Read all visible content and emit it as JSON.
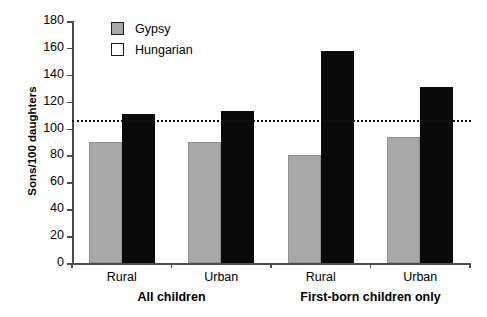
{
  "chart_data": {
    "type": "bar",
    "title": "",
    "xlabel": "",
    "ylabel": "Sons/100 daughters",
    "ylim": [
      0,
      180
    ],
    "yticks": [
      0,
      20,
      40,
      60,
      80,
      100,
      120,
      140,
      160,
      180
    ],
    "grid": false,
    "legend_position": "top-left-inside",
    "categories": [
      "Rural",
      "Urban",
      "Rural",
      "Urban"
    ],
    "groups": [
      {
        "label": "All children",
        "categories": [
          "Rural",
          "Urban"
        ]
      },
      {
        "label": "First-born children only",
        "categories": [
          "Rural",
          "Urban"
        ]
      }
    ],
    "series": [
      {
        "name": "Gypsy",
        "color": "#a8a8a8",
        "values": [
          90,
          90,
          80,
          94
        ]
      },
      {
        "name": "Hungarian",
        "color": "#0a0a0a",
        "values": [
          111,
          113,
          158,
          131
        ]
      }
    ],
    "annotations": [
      {
        "type": "hline",
        "value": 106,
        "style": "dotted",
        "color": "#111111"
      }
    ]
  },
  "legend": {
    "items": [
      {
        "label": "Gypsy",
        "swatch": "gray-filled-square"
      },
      {
        "label": "Hungarian",
        "swatch": "white-open-square"
      }
    ]
  },
  "axes": {
    "y_title": "Sons/100 daughters",
    "y_tick_labels": [
      "180",
      "160",
      "140",
      "120",
      "100",
      "80",
      "60",
      "40",
      "20",
      "0"
    ],
    "x_tick_labels": [
      "Rural",
      "Urban",
      "Rural",
      "Urban"
    ],
    "x_group_labels": [
      "All children",
      "First-born children only"
    ]
  },
  "colors": {
    "gypsy_bar": "#a8a8a8",
    "hungarian_bar": "#0a0a0a",
    "axis": "#4d4d4d",
    "refline": "#111111",
    "background": "#ffffff"
  }
}
